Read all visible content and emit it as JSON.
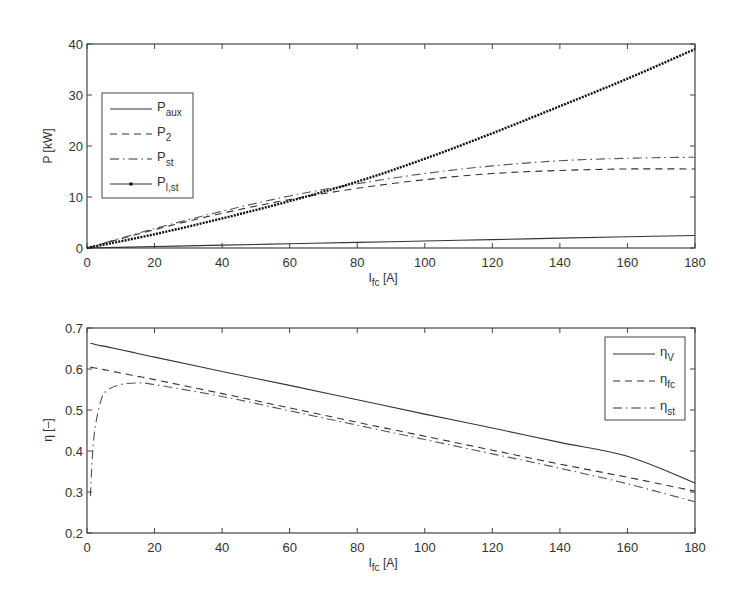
{
  "chart_data": [
    {
      "type": "line",
      "title": "",
      "xlabel": "I_fc [A]",
      "xlabel_main": "I",
      "xlabel_sub": "fc",
      "xlabel_unit": " [A]",
      "ylabel": "P [kW]",
      "xlim": [
        0,
        180
      ],
      "ylim": [
        0,
        40
      ],
      "xticks": [
        0,
        20,
        40,
        60,
        80,
        100,
        120,
        140,
        160,
        180
      ],
      "yticks": [
        0,
        10,
        20,
        30,
        40
      ],
      "grid": false,
      "legend_position": "upper-left",
      "x": [
        0,
        20,
        40,
        60,
        80,
        100,
        120,
        140,
        160,
        180
      ],
      "series": [
        {
          "name": "P_aux",
          "label_main": "P",
          "label_sub": "aux",
          "style": "solid",
          "values": [
            0,
            0.28,
            0.56,
            0.83,
            1.1,
            1.38,
            1.65,
            1.93,
            2.2,
            2.45
          ]
        },
        {
          "name": "P_2",
          "label_main": "P",
          "label_sub": "2",
          "style": "dashed",
          "values": [
            0,
            3.6,
            6.8,
            9.5,
            11.7,
            13.4,
            14.6,
            15.2,
            15.5,
            15.5
          ]
        },
        {
          "name": "P_st",
          "label_main": "P",
          "label_sub": "st",
          "style": "dashdot",
          "values": [
            0,
            3.8,
            7.2,
            10.2,
            12.6,
            14.6,
            16.1,
            17.1,
            17.6,
            17.8
          ]
        },
        {
          "name": "P_l,st",
          "label_main": "P",
          "label_sub": "l,st",
          "style": "solid-dots",
          "values": [
            0,
            2.7,
            5.8,
            9.2,
            13.0,
            17.5,
            22.5,
            27.8,
            33.2,
            39.0
          ]
        }
      ]
    },
    {
      "type": "line",
      "title": "",
      "xlabel": "I_fc [A]",
      "xlabel_main": "I",
      "xlabel_sub": "fc",
      "xlabel_unit": " [A]",
      "ylabel": "η [–]",
      "xlim": [
        0,
        180
      ],
      "ylim": [
        0.2,
        0.7
      ],
      "xticks": [
        0,
        20,
        40,
        60,
        80,
        100,
        120,
        140,
        160,
        180
      ],
      "yticks": [
        0.2,
        0.3,
        0.4,
        0.5,
        0.6,
        0.7
      ],
      "grid": false,
      "legend_position": "upper-right",
      "x": [
        1,
        2,
        4,
        6,
        10,
        15,
        20,
        40,
        60,
        80,
        100,
        120,
        140,
        160,
        180
      ],
      "series": [
        {
          "name": "η_V",
          "label_main": "η",
          "label_sub": "V",
          "style": "solid",
          "values": [
            0.663,
            0.661,
            0.657,
            0.654,
            0.647,
            0.638,
            0.629,
            0.594,
            0.56,
            0.525,
            0.49,
            0.456,
            0.421,
            0.387,
            0.322
          ]
        },
        {
          "name": "η_fc",
          "label_main": "η",
          "label_sub": "fc",
          "style": "dashed",
          "values": [
            0.604,
            0.603,
            0.6,
            0.597,
            0.59,
            0.582,
            0.574,
            0.54,
            0.505,
            0.47,
            0.436,
            0.402,
            0.368,
            0.336,
            0.302
          ]
        },
        {
          "name": "η_st",
          "label_main": "η",
          "label_sub": "st",
          "style": "dashdot",
          "values": [
            0.29,
            0.43,
            0.52,
            0.548,
            0.562,
            0.566,
            0.562,
            0.533,
            0.498,
            0.463,
            0.428,
            0.393,
            0.358,
            0.32,
            0.276
          ]
        }
      ]
    }
  ]
}
